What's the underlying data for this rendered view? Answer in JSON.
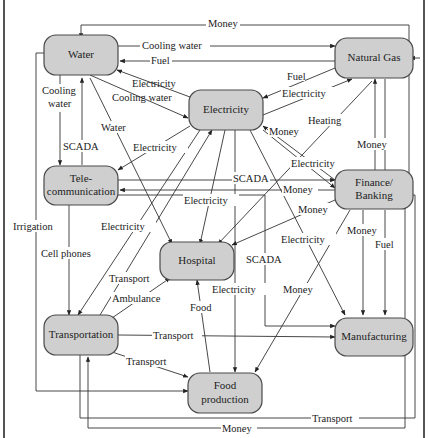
{
  "diagram": {
    "nodes": {
      "water": "Water",
      "natural_gas": "Natural Gas",
      "electricity": "Electricity",
      "telecom_1": "Tele-",
      "telecom_2": "communication",
      "finance_1": "Finance/",
      "finance_2": "Banking",
      "hospital": "Hospital",
      "transportation": "Transportation",
      "manufacturing": "Manufacturing",
      "food_1": "Food",
      "food_2": "production"
    },
    "edge_labels": {
      "money_top": "Money",
      "cooling_water_top": "Cooling water",
      "fuel_top": "Fuel",
      "elec_to_water": "Electricity",
      "cooling_water_elec": "Cooling water",
      "fuel_gas_elec": "Fuel",
      "elec_to_gas": "Electricity",
      "cooling_water_telecom_1": "Cooling",
      "cooling_water_telecom_2": "water",
      "water_hospital": "Water",
      "heating": "Heating",
      "money_fin_elec": "Money",
      "scada_telecom_water": "SCADA",
      "elec_to_telecom": "Electricity",
      "elec_to_fin": "Electricity",
      "scada_mid": "SCADA",
      "money_telecom_fin": "Money",
      "money_gas_fin": "Money",
      "irrigation": "Irrigation",
      "elec_to_transport": "Electricity",
      "elec_to_hospital": "Electricity",
      "money_fin_hospital": "Money",
      "elec_to_mfg": "Electricity",
      "cell_phones": "Cell phones",
      "scada_mfg": "SCADA",
      "money_fin_mfg": "Money",
      "fuel_fin": "Fuel",
      "transport_hospital": "Transport",
      "ambulance": "Ambulance",
      "elec_to_food": "Electricity",
      "food": "Food",
      "money_food": "Money",
      "transport_mfg": "Transport",
      "transport_food": "Transport",
      "transport_bottom": "Transport",
      "money_bottom": "Money"
    }
  }
}
